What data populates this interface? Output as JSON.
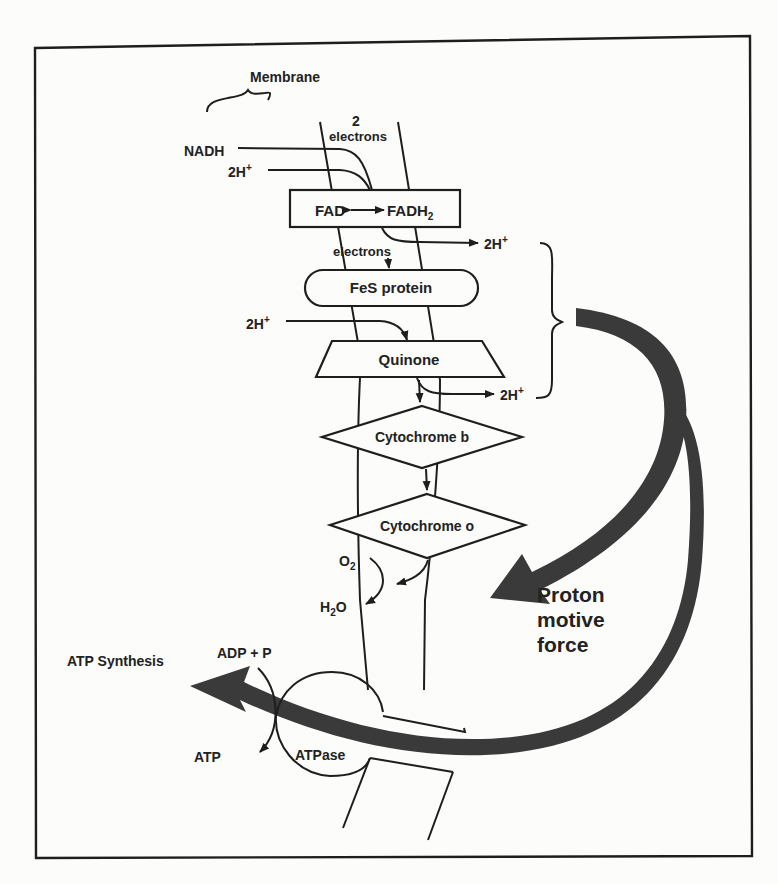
{
  "diagram": {
    "membrane_label": "Membrane",
    "electrons_top": {
      "count": "2",
      "label": "electrons"
    },
    "inputs": {
      "nadh": "NADH",
      "h_in_1": "2H",
      "h_in_2": "2H",
      "plus": "+"
    },
    "components": [
      {
        "id": "fad",
        "label_a": "FAD",
        "label_b": "FADH",
        "sub": "2",
        "shape": "rectangle"
      },
      {
        "id": "fes",
        "label": "FeS protein",
        "shape": "rounded-rectangle"
      },
      {
        "id": "quinone",
        "label": "Quinone",
        "shape": "trapezoid"
      },
      {
        "id": "cyt_b",
        "label": "Cytochrome b",
        "shape": "diamond"
      },
      {
        "id": "cyt_o",
        "label": "Cytochrome o",
        "shape": "diamond"
      }
    ],
    "electrons_mid": "electrons",
    "outputs": {
      "h_out_1": "2H",
      "h_out_2": "2H"
    },
    "oxygen": {
      "o2": "O",
      "o2_sub": "2",
      "h2o_h": "H",
      "h2o_sub": "2",
      "h2o_o": "O"
    },
    "pmf_label": [
      "Proton",
      "motive",
      "force"
    ],
    "atpase": {
      "label": "ATPase",
      "substrate": "ADP + P",
      "product": "ATP",
      "process": "ATP Synthesis"
    },
    "colors": {
      "ink": "#1e1e1e",
      "arrow": "#3a3a3a",
      "paper": "#fcfcfa"
    }
  }
}
